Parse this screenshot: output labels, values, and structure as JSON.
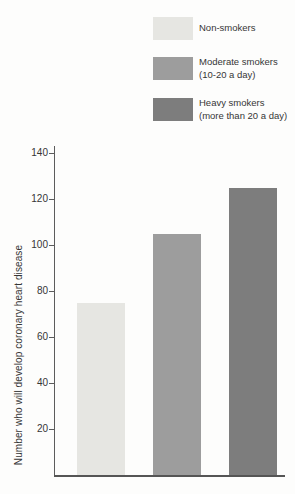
{
  "chart_data": {
    "type": "bar",
    "categories": [
      "Non-smokers",
      "Moderate smokers (10-20 a day)",
      "Heavy smokers (more than 20 a day)"
    ],
    "values": [
      75,
      105,
      125
    ],
    "bar_colors": [
      "#e6e6e2",
      "#9d9d9d",
      "#7d7d7d"
    ],
    "title": "",
    "xlabel": "",
    "ylabel": "Number who will develop coronary heart disease",
    "ylim": [
      0,
      140
    ],
    "yticks": [
      20,
      40,
      60,
      80,
      100,
      120,
      140
    ],
    "grid": false,
    "legend_position": "top-right",
    "legend": [
      {
        "lines": [
          "Non-smokers"
        ],
        "color": "#e6e6e2"
      },
      {
        "lines": [
          "Moderate smokers",
          "(10-20 a day)"
        ],
        "color": "#9d9d9d"
      },
      {
        "lines": [
          "Heavy smokers",
          "(more than 20 a day)"
        ],
        "color": "#7d7d7d"
      }
    ]
  },
  "colors": {
    "background": "#fdfdfc",
    "axis": "#5c5c5c",
    "text": "#363636"
  }
}
